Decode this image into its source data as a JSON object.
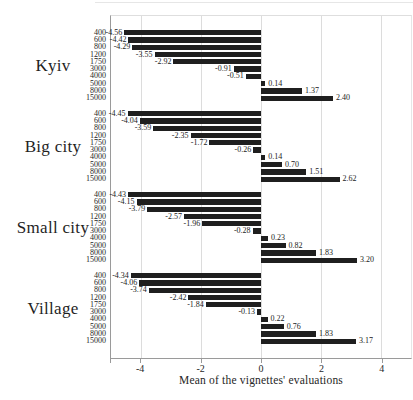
{
  "figure": {
    "background": "#ffffff",
    "bar_color": "#1f1f1f",
    "gridline_color": "#dcdcdc",
    "axis_line_color": "#9a9a9a"
  },
  "chart_data": {
    "type": "bar",
    "orientation": "horizontal",
    "title": "",
    "xlabel": "Mean of the vignettes' evaluations",
    "ylabel": "",
    "xlim": [
      -5,
      5
    ],
    "x_ticks": [
      -4,
      -2,
      0,
      2,
      4
    ],
    "grid": true,
    "legend": false,
    "value_label_decimals": 2,
    "categories": [
      "400",
      "600",
      "800",
      "1200",
      "1750",
      "3000",
      "4000",
      "5000",
      "8000",
      "15000"
    ],
    "groups": [
      {
        "label": "Kyiv",
        "values": [
          -4.56,
          -4.42,
          -4.29,
          -3.55,
          -2.92,
          -0.91,
          -0.51,
          0.14,
          1.37,
          2.4
        ]
      },
      {
        "label": "Big city",
        "values": [
          -4.45,
          -4.04,
          -3.59,
          -2.35,
          -1.72,
          -0.26,
          0.14,
          0.7,
          1.51,
          2.62
        ]
      },
      {
        "label": "Small city",
        "values": [
          -4.43,
          -4.15,
          -3.79,
          -2.57,
          -1.96,
          -0.28,
          0.23,
          0.82,
          1.83,
          3.2
        ]
      },
      {
        "label": "Village",
        "values": [
          -4.34,
          -4.06,
          -3.74,
          -2.42,
          -1.84,
          -0.13,
          0.22,
          0.76,
          1.83,
          3.17
        ]
      }
    ]
  }
}
